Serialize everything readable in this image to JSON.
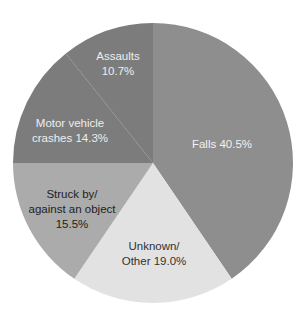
{
  "chart_data": {
    "type": "pie",
    "title": "",
    "start_angle_deg": 0,
    "direction": "clockwise",
    "center": [
      153,
      163
    ],
    "radius": 140,
    "slices": [
      {
        "name": "Falls",
        "value": 40.5,
        "label_lines": [
          "Falls 40.5%"
        ],
        "color": "#8e8e8e",
        "text_color": "#f2f2f2",
        "label_pos": [
          222,
          144
        ]
      },
      {
        "name": "Unknown/Other",
        "value": 19.0,
        "label_lines": [
          "Unknown/",
          "Other 19.0%"
        ],
        "color": "#e2e2e2",
        "text_color": "#333333",
        "label_pos": [
          154,
          254
        ]
      },
      {
        "name": "Struck by/against an object",
        "value": 15.5,
        "label_lines": [
          "Struck by/",
          "against an object",
          "15.5%"
        ],
        "color": "#ababab",
        "text_color": "#222222",
        "label_pos": [
          72,
          209
        ]
      },
      {
        "name": "Motor vehicle crashes",
        "value": 14.3,
        "label_lines": [
          "Motor vehicle",
          "crashes 14.3%"
        ],
        "color": "#7c7c7c",
        "text_color": "#eeeeee",
        "label_pos": [
          70,
          131
        ]
      },
      {
        "name": "Assaults",
        "value": 10.7,
        "label_lines": [
          "Assaults",
          "10.7%"
        ],
        "color": "#7c7c7c",
        "text_color": "#eeeeee",
        "label_pos": [
          118,
          64
        ]
      }
    ],
    "categories": [
      "Falls",
      "Unknown/Other",
      "Struck by/against an object",
      "Motor vehicle crashes",
      "Assaults"
    ],
    "values": [
      40.5,
      19.0,
      15.5,
      14.3,
      10.7
    ],
    "unit": "%",
    "legend": "none (labels inside slices)"
  }
}
